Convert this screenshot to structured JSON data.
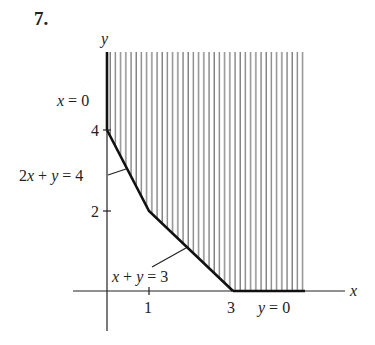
{
  "problem": {
    "number": "7."
  },
  "axes": {
    "x_label": "x",
    "y_label": "y"
  },
  "ticks": {
    "x": [
      {
        "value": 1,
        "label": "1"
      },
      {
        "value": 3,
        "label": "3"
      }
    ],
    "y": [
      {
        "value": 2,
        "label": "2"
      },
      {
        "value": 4,
        "label": "4"
      }
    ]
  },
  "constraints": [
    {
      "label_lhs": "x",
      "label_rhs": " = 0",
      "text": "x = 0"
    },
    {
      "text": "2x + y = 4"
    },
    {
      "text": "x + y = 3"
    },
    {
      "label_lhs": "y",
      "label_rhs": " = 0",
      "text": "y = 0"
    }
  ],
  "feasible_region": {
    "vertices": [
      [
        0,
        4
      ],
      [
        1,
        2
      ],
      [
        3,
        0
      ]
    ],
    "shading": "vertical-hatch",
    "unbounded": true
  },
  "colors": {
    "ink": "#222222",
    "hatch": "#555555",
    "background": "#ffffff"
  }
}
